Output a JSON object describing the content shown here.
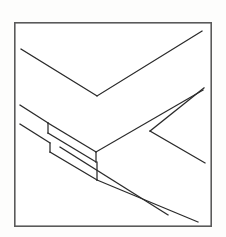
{
  "figure": {
    "background_color": "#fdfdfc",
    "paper_color": "#ffffff",
    "line_color": "#2a2a2a",
    "frame_color": "#5a5a5a",
    "canvas": {
      "width": 226,
      "height": 237
    }
  },
  "frame": {
    "name": "border-rectangle",
    "x": 14,
    "y": 22,
    "width": 198,
    "height": 205,
    "stroke_width": 1.6
  },
  "chart_data": {
    "type": "line",
    "xlabel": "",
    "ylabel": "",
    "xlim": [
      0,
      226
    ],
    "ylim": [
      0,
      237
    ],
    "grid": false,
    "legend": null,
    "strokes": [
      {
        "name": "upper-left-board-top-edge",
        "points": [
          [
            21,
            49
          ],
          [
            97,
            96
          ]
        ]
      },
      {
        "name": "upper-right-board-top-edge",
        "points": [
          [
            97,
            96
          ],
          [
            202,
            31
          ]
        ]
      },
      {
        "name": "left-board-upper-edge",
        "points": [
          [
            20,
            105
          ],
          [
            48,
            123
          ]
        ]
      },
      {
        "name": "left-board-lower-edge",
        "points": [
          [
            20,
            124
          ],
          [
            50,
            143
          ]
        ]
      },
      {
        "name": "notch-riser-left-upper",
        "points": [
          [
            48,
            123
          ],
          [
            48,
            133
          ]
        ]
      },
      {
        "name": "notch-riser-left-lower",
        "points": [
          [
            50,
            143
          ],
          [
            50,
            152
          ]
        ]
      },
      {
        "name": "notch-face-upper",
        "points": [
          [
            48,
            133
          ],
          [
            96,
            162
          ]
        ]
      },
      {
        "name": "notch-face-lower",
        "points": [
          [
            50,
            152
          ],
          [
            97,
            180
          ]
        ]
      },
      {
        "name": "lap-top-edge",
        "points": [
          [
            48,
            123
          ],
          [
            96,
            152
          ]
        ]
      },
      {
        "name": "notch-riser-right-upper",
        "points": [
          [
            96,
            152
          ],
          [
            96,
            162
          ]
        ]
      },
      {
        "name": "notch-riser-right-lower",
        "points": [
          [
            97,
            162
          ],
          [
            97,
            180
          ]
        ]
      },
      {
        "name": "lower-board-far-edge",
        "points": [
          [
            96,
            152
          ],
          [
            203,
            90
          ]
        ]
      },
      {
        "name": "lower-board-near-edge-long",
        "points": [
          [
            97,
            180
          ],
          [
            198,
            222
          ]
        ]
      },
      {
        "name": "lower-board-inner-edge",
        "points": [
          [
            60,
            147
          ],
          [
            168,
            215
          ]
        ]
      },
      {
        "name": "right-branch-stem",
        "points": [
          [
            150,
            131
          ],
          [
            205,
            163
          ]
        ]
      },
      {
        "name": "right-branch-upper",
        "points": [
          [
            150,
            131
          ],
          [
            204,
            88
          ]
        ]
      },
      {
        "name": "right-junction-node",
        "points": [
          [
            150,
            131
          ]
        ]
      }
    ],
    "annotations": []
  },
  "elements": {
    "figure_name": "line-drawing-figure",
    "frame_name": "drawing-frame",
    "canvas_name": "drawing-canvas"
  }
}
